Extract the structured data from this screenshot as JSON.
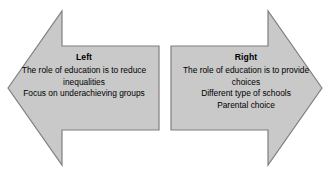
{
  "diagram": {
    "type": "double-headed-opposing-arrows",
    "background_color": "#ffffff",
    "shape_fill_color": "#c9c9c9",
    "shape_border_color": "#7f7f7f",
    "text_color": "#000000",
    "left_arrow": {
      "direction": "left",
      "title": "Left",
      "lines": [
        "The role of education is to reduce",
        "inequalities",
        "Focus on underachieving groups"
      ]
    },
    "right_arrow": {
      "direction": "right",
      "title": "Right",
      "lines": [
        "The role of education is to provide",
        "choices",
        "Different type of schools",
        "Parental choice"
      ]
    }
  }
}
